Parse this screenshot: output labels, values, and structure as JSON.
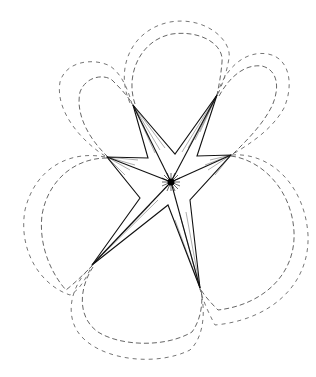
{
  "figure": {
    "colors": {
      "background": "#ffffff",
      "ink": "#111111",
      "dashed": "#666666"
    },
    "center": [
      171,
      182
    ],
    "tips": [
      {
        "name": "top-left",
        "x": 133,
        "y": 105
      },
      {
        "name": "top-right",
        "x": 217,
        "y": 95
      },
      {
        "name": "right",
        "x": 231,
        "y": 155
      },
      {
        "name": "bottom-right",
        "x": 200,
        "y": 288
      },
      {
        "name": "bottom-left",
        "x": 92,
        "y": 265
      },
      {
        "name": "left",
        "x": 107,
        "y": 157
      }
    ],
    "inner_vertices": [
      {
        "x": 175,
        "y": 154
      },
      {
        "x": 197,
        "y": 156
      },
      {
        "x": 190,
        "y": 200
      },
      {
        "x": 168,
        "y": 205
      },
      {
        "x": 140,
        "y": 198
      },
      {
        "x": 148,
        "y": 158
      }
    ]
  }
}
